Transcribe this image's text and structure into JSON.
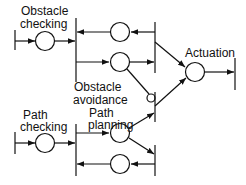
{
  "diagram": {
    "type": "petri-net",
    "colors": {
      "stroke": "#111111",
      "background": "#ffffff"
    },
    "labels": {
      "obstacle_checking_1": "Obstacle",
      "obstacle_checking_2": "checking",
      "obstacle_avoidance_1": "Obstacle",
      "obstacle_avoidance_2": "avoidance",
      "path_planning_1": "Path",
      "path_planning_2": "planning",
      "path_checking_1": "Path",
      "path_checking_2": "checking",
      "actuation": "Actuation"
    },
    "places": [
      {
        "id": "obstacle-checking",
        "label": "Obstacle checking"
      },
      {
        "id": "obstacle-return",
        "label": ""
      },
      {
        "id": "obstacle-avoidance",
        "label": "Obstacle avoidance"
      },
      {
        "id": "actuation",
        "label": "Actuation"
      },
      {
        "id": "path-checking",
        "label": "Path checking"
      },
      {
        "id": "path-planning",
        "label": "Path planning"
      },
      {
        "id": "path-return",
        "label": ""
      }
    ],
    "arcs": [
      {
        "from": "obstacle-checking",
        "to": "fork-transition-obstacle"
      },
      {
        "from": "obstacle-return",
        "to": "fork-transition-obstacle"
      },
      {
        "from": "fork-transition-obstacle",
        "to": "obstacle-avoidance"
      },
      {
        "from": "obstacle-avoidance",
        "to": "join-transition-obstacle"
      },
      {
        "from": "join-transition-obstacle",
        "to": "obstacle-return"
      },
      {
        "from": "join-transition-obstacle",
        "to": "actuation"
      },
      {
        "from": "obstacle-avoidance",
        "to": "actuation-transition-path",
        "type": "inhibitor"
      },
      {
        "from": "path-planning",
        "to": "actuation-transition-path"
      },
      {
        "from": "actuation-transition-path",
        "to": "actuation"
      },
      {
        "from": "actuation",
        "to": "output-transition"
      },
      {
        "from": "path-checking",
        "to": "fork-transition-path"
      },
      {
        "from": "fork-transition-path",
        "to": "path-planning"
      },
      {
        "from": "path-planning",
        "to": "join-transition-path"
      },
      {
        "from": "join-transition-path",
        "to": "path-return"
      },
      {
        "from": "path-return",
        "to": "fork-transition-path"
      }
    ]
  }
}
